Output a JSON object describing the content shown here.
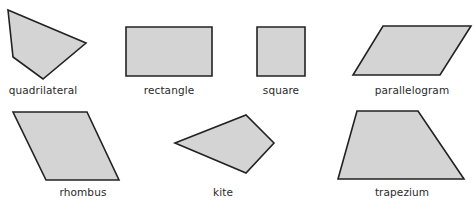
{
  "colors": {
    "fill": "#d4d4d4",
    "stroke": "#222222",
    "text": "#2a2a2a"
  },
  "shapes": [
    {
      "name": "quadrilateral",
      "label": "quadrilateral",
      "points": "8,10 86,43 43,79 13,57",
      "label_x": 43,
      "label_y": 84
    },
    {
      "name": "rectangle",
      "label": "rectangle",
      "points": "126,27 212,27 212,76 126,76",
      "label_x": 169,
      "label_y": 84
    },
    {
      "name": "square",
      "label": "square",
      "points": "257,27 305,27 305,76 257,76",
      "label_x": 281,
      "label_y": 84
    },
    {
      "name": "parallelogram",
      "label": "parallelogram",
      "points": "383,26 471,26 440,75 353,75",
      "label_x": 412,
      "label_y": 84
    },
    {
      "name": "rhombus",
      "label": "rhombus",
      "points": "13,112 87,112 119,180 46,180",
      "label_x": 83,
      "label_y": 186
    },
    {
      "name": "kite",
      "label": "kite",
      "points": "175,143 246,115 274,143 246,173",
      "label_x": 223,
      "label_y": 186
    },
    {
      "name": "trapezium",
      "label": "trapezium",
      "points": "357,111 418,111 464,179 338,179",
      "label_x": 402,
      "label_y": 186
    }
  ]
}
